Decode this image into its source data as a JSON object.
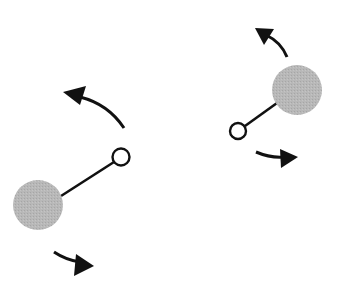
{
  "diagram": {
    "colors": {
      "background": "#ffffff",
      "large_sphere_fill": "#b4b4b4",
      "small_sphere_fill": "#ffffff",
      "stroke": "#111111"
    },
    "molecules": [
      {
        "id": "left",
        "large_sphere": {
          "cx": 38,
          "cy": 205,
          "r": 25
        },
        "small_sphere": {
          "cx": 121,
          "cy": 157,
          "r": 8.5
        },
        "rod": {
          "x1": 62,
          "y1": 196,
          "x2": 113,
          "y2": 162
        },
        "arrows": [
          {
            "id": "upper",
            "direction": "counterclockwise-up-left"
          },
          {
            "id": "lower",
            "direction": "down-right"
          }
        ]
      },
      {
        "id": "right",
        "large_sphere": {
          "cx": 297,
          "cy": 90,
          "r": 25
        },
        "small_sphere": {
          "cx": 238,
          "cy": 131,
          "r": 8
        },
        "rod": {
          "x1": 245,
          "y1": 126,
          "x2": 276,
          "y2": 104
        },
        "arrows": [
          {
            "id": "upper",
            "direction": "counterclockwise-up-left"
          },
          {
            "id": "lower",
            "direction": "right"
          }
        ]
      }
    ]
  }
}
